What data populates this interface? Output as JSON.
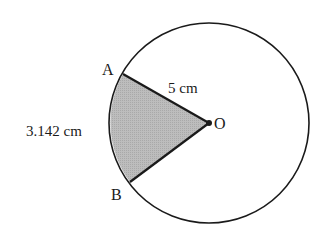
{
  "diagram": {
    "type": "circle-sector",
    "center_label": "O",
    "point_labels": {
      "a": "A",
      "b": "B"
    },
    "radius_label": "5 cm",
    "arc_label": "3.142 cm",
    "colors": {
      "stroke": "#1a1a1a",
      "sector_fill": "#b8b8b8",
      "background": "#ffffff"
    }
  }
}
